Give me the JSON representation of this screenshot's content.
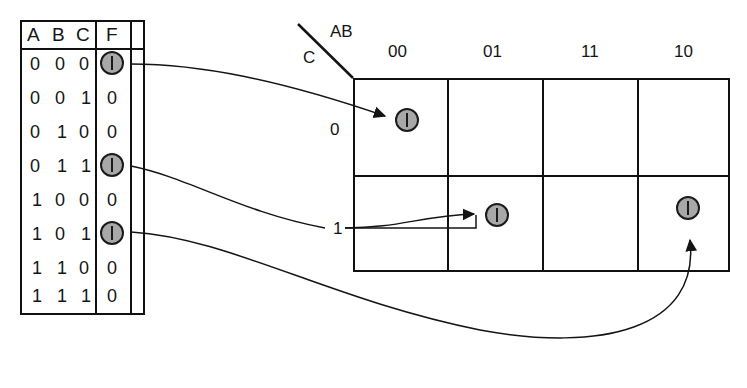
{
  "figure": {
    "ink_color": "#141414",
    "marker_fill": "#a8a8a8",
    "marker_stroke": "#1a1a1a",
    "background": "#ffffff"
  },
  "truth_table": {
    "name": "truth-table",
    "headers": [
      "A",
      "B",
      "C",
      "F"
    ],
    "header_A": "A",
    "header_B": "B",
    "header_C": "C",
    "header_F": "F",
    "rows": [
      {
        "A": "0",
        "B": "0",
        "C": "0",
        "F": "1",
        "f_is_marked": true
      },
      {
        "A": "0",
        "B": "0",
        "C": "1",
        "F": "0",
        "f_is_marked": false
      },
      {
        "A": "0",
        "B": "1",
        "C": "0",
        "F": "0",
        "f_is_marked": false
      },
      {
        "A": "0",
        "B": "1",
        "C": "1",
        "F": "1",
        "f_is_marked": true
      },
      {
        "A": "1",
        "B": "0",
        "C": "0",
        "F": "0",
        "f_is_marked": false
      },
      {
        "A": "1",
        "B": "0",
        "C": "1",
        "F": "1",
        "f_is_marked": true
      },
      {
        "A": "1",
        "B": "1",
        "C": "0",
        "F": "0",
        "f_is_marked": false
      },
      {
        "A": "1",
        "B": "1",
        "C": "1",
        "F": "0",
        "f_is_marked": false
      }
    ]
  },
  "kmap": {
    "name": "karnaugh-map",
    "corner_top_label": "AB",
    "corner_bottom_label": "C",
    "column_headers": [
      "00",
      "01",
      "11",
      "10"
    ],
    "row_headers": [
      "0",
      "1"
    ],
    "cells": [
      {
        "row": "0",
        "col": "00",
        "value": "1",
        "marked": true
      },
      {
        "row": "0",
        "col": "01",
        "value": "",
        "marked": false
      },
      {
        "row": "0",
        "col": "11",
        "value": "",
        "marked": false
      },
      {
        "row": "0",
        "col": "10",
        "value": "",
        "marked": false
      },
      {
        "row": "1",
        "col": "00",
        "value": "",
        "marked": false
      },
      {
        "row": "1",
        "col": "01",
        "value": "1",
        "marked": true
      },
      {
        "row": "1",
        "col": "11",
        "value": "",
        "marked": false
      },
      {
        "row": "1",
        "col": "10",
        "value": "1",
        "marked": true
      }
    ]
  },
  "mappings": [
    {
      "name": "map-row-000-to-cell-00-0",
      "from_row": "000",
      "to_cell": "AB=00,C=0"
    },
    {
      "name": "map-row-011-to-cell-01-1",
      "from_row": "011",
      "to_cell": "AB=01,C=1"
    },
    {
      "name": "map-row-101-to-cell-10-1",
      "from_row": "101",
      "to_cell": "AB=10,C=1"
    }
  ]
}
